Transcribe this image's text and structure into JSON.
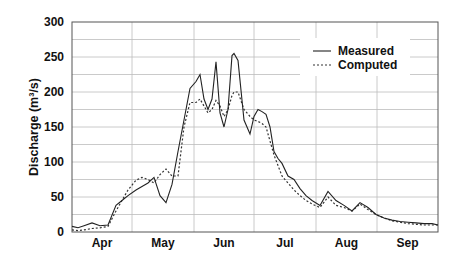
{
  "chart_data": {
    "type": "line",
    "title": "",
    "xlabel": "",
    "ylabel": "Discharge (m³/s)",
    "ylim": [
      0,
      300
    ],
    "yticks": [
      0,
      50,
      100,
      150,
      200,
      250,
      300
    ],
    "month_labels": [
      "Apr",
      "May",
      "Jun",
      "Jul",
      "Aug",
      "Sep"
    ],
    "grid": true,
    "legend_position": "upper right",
    "x_unit": "day since Apr 1",
    "xlim": [
      0,
      183
    ],
    "series": [
      {
        "name": "Measured",
        "style": "solid",
        "x": [
          0,
          3,
          6,
          10,
          14,
          18,
          22,
          25,
          28,
          32,
          35,
          38,
          41,
          44,
          47,
          50,
          53,
          56,
          59,
          62,
          64,
          66,
          68,
          70,
          72,
          74,
          76,
          78,
          80,
          81,
          83,
          86,
          89,
          91,
          93,
          95,
          97,
          99,
          101,
          103,
          105,
          108,
          111,
          114,
          117,
          120,
          124,
          128,
          132,
          136,
          140,
          144,
          148,
          152,
          156,
          160,
          164,
          168,
          172,
          176,
          180,
          183
        ],
        "values": [
          8,
          6,
          9,
          13,
          9,
          10,
          38,
          45,
          52,
          60,
          65,
          70,
          78,
          52,
          42,
          68,
          115,
          160,
          205,
          215,
          225,
          190,
          175,
          190,
          243,
          170,
          150,
          175,
          252,
          255,
          245,
          160,
          140,
          165,
          175,
          172,
          168,
          150,
          115,
          105,
          98,
          80,
          75,
          62,
          52,
          45,
          38,
          58,
          45,
          38,
          30,
          42,
          35,
          25,
          20,
          17,
          15,
          14,
          13,
          12,
          12,
          10
        ]
      },
      {
        "name": "Computed",
        "style": "dotted",
        "x": [
          0,
          3,
          6,
          10,
          14,
          18,
          22,
          25,
          28,
          32,
          35,
          38,
          41,
          44,
          47,
          50,
          53,
          56,
          59,
          62,
          64,
          66,
          68,
          70,
          72,
          74,
          76,
          78,
          80,
          81,
          83,
          86,
          89,
          91,
          93,
          95,
          97,
          99,
          101,
          103,
          105,
          108,
          111,
          114,
          117,
          120,
          124,
          128,
          132,
          136,
          140,
          144,
          148,
          152,
          156,
          160,
          164,
          168,
          172,
          176,
          180,
          183
        ],
        "values": [
          3,
          2,
          3,
          5,
          6,
          8,
          30,
          45,
          60,
          74,
          78,
          75,
          70,
          82,
          90,
          80,
          80,
          150,
          185,
          185,
          190,
          180,
          170,
          175,
          188,
          180,
          165,
          175,
          195,
          200,
          200,
          175,
          165,
          160,
          158,
          155,
          150,
          130,
          110,
          95,
          80,
          70,
          60,
          52,
          45,
          40,
          35,
          50,
          38,
          35,
          30,
          40,
          32,
          25,
          20,
          16,
          14,
          12,
          11,
          10,
          10,
          10
        ]
      }
    ]
  },
  "legend": {
    "measured_label": "Measured",
    "computed_label": "Computed"
  },
  "axes": {
    "ylabel": "Discharge (m³/s)",
    "yticks": [
      "0",
      "50",
      "100",
      "150",
      "200",
      "250",
      "300"
    ],
    "xticks": [
      "Apr",
      "May",
      "Jun",
      "Jul",
      "Aug",
      "Sep"
    ]
  },
  "colors": {
    "line": "#222222",
    "grid": "#bdbdbd",
    "axis": "#444444"
  }
}
